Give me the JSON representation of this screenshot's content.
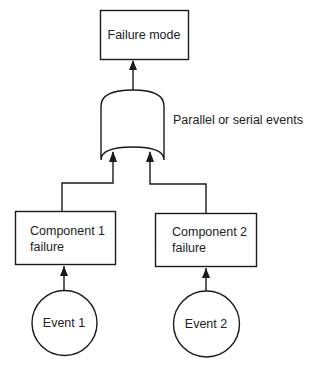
{
  "diagram": {
    "type": "fault-tree",
    "top_event": {
      "label": "Failure mode"
    },
    "gate": {
      "label": "Parallel or serial events",
      "shape": "or-gate"
    },
    "components": [
      {
        "line1": "Component 1",
        "line2": "failure"
      },
      {
        "line1": "Component 2",
        "line2": "failure"
      }
    ],
    "events": [
      {
        "label": "Event 1"
      },
      {
        "label": "Event 2"
      }
    ],
    "colors": {
      "stroke": "#1a1a1a",
      "text": "#222222",
      "background": "#ffffff"
    }
  }
}
